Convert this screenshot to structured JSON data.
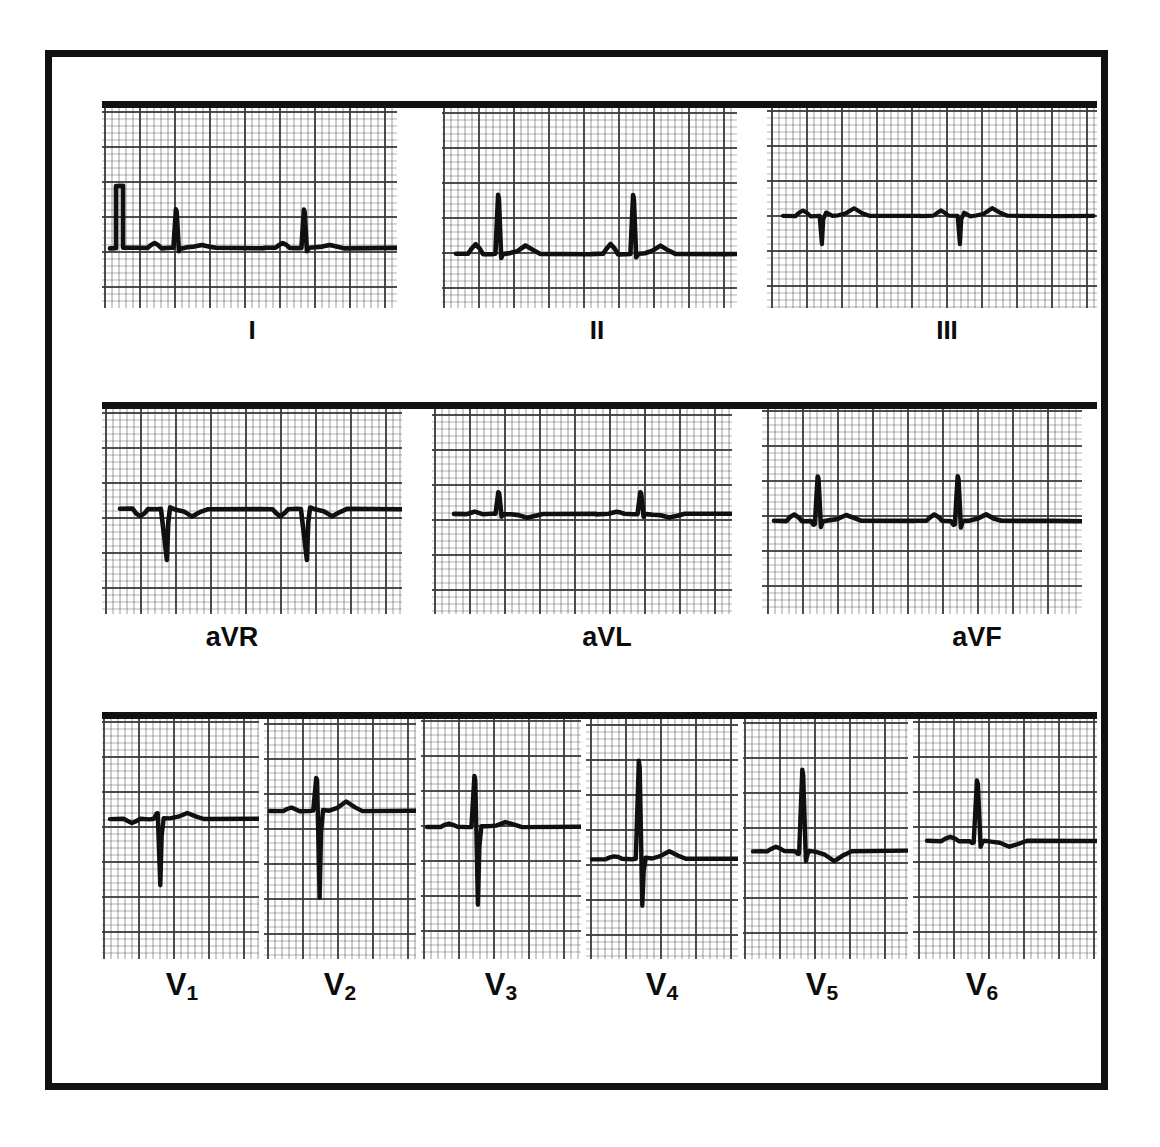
{
  "document": {
    "kind": "12-lead-electrocardiogram",
    "border_color": "#111111",
    "trace_color": "#101010",
    "grid_color": "#3a3a3a",
    "paper_color": "#ffffff",
    "background": "#ffffff"
  },
  "labels": {
    "lead_I": "I",
    "lead_II": "II",
    "lead_III": "III",
    "lead_aVR": "aVR",
    "lead_aVL": "aVL",
    "lead_aVF": "aVF",
    "lead_V1": "V",
    "lead_V1_sub": "1",
    "lead_V2": "V",
    "lead_V2_sub": "2",
    "lead_V3": "V",
    "lead_V3_sub": "3",
    "lead_V4": "V",
    "lead_V4_sub": "4",
    "lead_V5": "V",
    "lead_V5_sub": "5",
    "lead_V6": "V",
    "lead_V6_sub": "6"
  },
  "chart_data": {
    "type": "line",
    "xlabel": "",
    "ylabel": "",
    "grid": true,
    "legend_position": "below-each-panel",
    "paper_speed": "25 mm/s",
    "calibration": "10 mm/mV",
    "grid_small_px": 7,
    "grid_large_px": 35,
    "rows": [
      {
        "name": "limb-leads",
        "leads": [
          "I",
          "II",
          "III"
        ]
      },
      {
        "name": "augmented-limb-leads",
        "leads": [
          "aVR",
          "aVL",
          "aVF"
        ]
      },
      {
        "name": "precordial-leads",
        "leads": [
          "V1",
          "V2",
          "V3",
          "V4",
          "V5",
          "V6"
        ]
      }
    ],
    "series": [
      {
        "name": "I",
        "beats": 2,
        "cal_pulse": true,
        "p_amp": 0.08,
        "q_amp": 0.0,
        "r_amp": 0.62,
        "s_amp": 0.05,
        "t_amp": 0.05,
        "baseline_mv": 0.0,
        "qrs_polarity": "positive"
      },
      {
        "name": "II",
        "beats": 2,
        "cal_pulse": false,
        "p_amp": 0.16,
        "q_amp": 0.0,
        "r_amp": 0.95,
        "s_amp": 0.06,
        "t_amp": 0.14,
        "baseline_mv": 0.0,
        "qrs_polarity": "positive"
      },
      {
        "name": "III",
        "beats": 2,
        "cal_pulse": false,
        "p_amp": 0.09,
        "q_amp": 0.45,
        "r_amp": 0.05,
        "s_amp": 0.0,
        "t_amp": 0.12,
        "baseline_mv": 0.0,
        "qrs_polarity": "negative"
      },
      {
        "name": "aVR",
        "beats": 2,
        "cal_pulse": false,
        "p_amp": -0.12,
        "q_amp": 0.0,
        "r_amp": 0.0,
        "s_amp": 0.82,
        "t_amp": -0.12,
        "baseline_mv": 0.0,
        "qrs_polarity": "negative"
      },
      {
        "name": "aVL",
        "beats": 2,
        "cal_pulse": false,
        "p_amp": 0.04,
        "q_amp": 0.0,
        "r_amp": 0.35,
        "s_amp": 0.04,
        "t_amp": -0.06,
        "baseline_mv": 0.0,
        "qrs_polarity": "positive"
      },
      {
        "name": "aVF",
        "beats": 2,
        "cal_pulse": false,
        "p_amp": 0.11,
        "q_amp": 0.06,
        "r_amp": 0.72,
        "s_amp": 0.1,
        "t_amp": 0.1,
        "baseline_mv": 0.0,
        "qrs_polarity": "positive"
      },
      {
        "name": "V1",
        "beats": 1,
        "cal_pulse": false,
        "p_amp": -0.06,
        "q_amp": 0.0,
        "r_amp": 0.1,
        "s_amp": 1.1,
        "t_amp": 0.1,
        "baseline_mv": 0.0,
        "qrs_polarity": "negative"
      },
      {
        "name": "V2",
        "beats": 1,
        "cal_pulse": false,
        "p_amp": 0.05,
        "q_amp": 0.0,
        "r_amp": 0.55,
        "s_amp": 1.45,
        "t_amp": 0.16,
        "baseline_mv": 0.0,
        "qrs_polarity": "negative"
      },
      {
        "name": "V3",
        "beats": 1,
        "cal_pulse": false,
        "p_amp": 0.06,
        "q_amp": 0.0,
        "r_amp": 0.85,
        "s_amp": 1.3,
        "t_amp": 0.08,
        "baseline_mv": 0.0,
        "qrs_polarity": "equiphasic"
      },
      {
        "name": "V4",
        "beats": 1,
        "cal_pulse": false,
        "p_amp": 0.05,
        "q_amp": 0.0,
        "r_amp": 1.7,
        "s_amp": 0.8,
        "t_amp": 0.14,
        "baseline_mv": 0.0,
        "qrs_polarity": "positive"
      },
      {
        "name": "V5",
        "beats": 1,
        "cal_pulse": false,
        "p_amp": 0.07,
        "q_amp": 0.04,
        "r_amp": 1.4,
        "s_amp": 0.18,
        "t_amp": -0.18,
        "baseline_mv": 0.0,
        "qrs_polarity": "positive"
      },
      {
        "name": "V6",
        "beats": 1,
        "cal_pulse": false,
        "p_amp": 0.07,
        "q_amp": 0.03,
        "r_amp": 1.05,
        "s_amp": 0.1,
        "t_amp": -0.1,
        "baseline_mv": 0.0,
        "qrs_polarity": "positive"
      }
    ]
  }
}
